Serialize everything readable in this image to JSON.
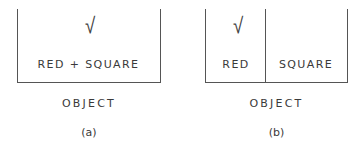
{
  "figure": {
    "panels": [
      {
        "id": "a",
        "sub_label": "(a)",
        "caption": "OBJECT",
        "cells": [
          {
            "label": "RED + SQUARE",
            "checked": true,
            "check_glyph": "√"
          }
        ]
      },
      {
        "id": "b",
        "sub_label": "(b)",
        "caption": "OBJECT",
        "cells": [
          {
            "label": "RED",
            "checked": true,
            "check_glyph": "√"
          },
          {
            "label": "SQUARE",
            "checked": false
          }
        ]
      }
    ]
  },
  "colors": {
    "line": "#555555",
    "text": "#3a3a3a",
    "background": "#ffffff"
  }
}
